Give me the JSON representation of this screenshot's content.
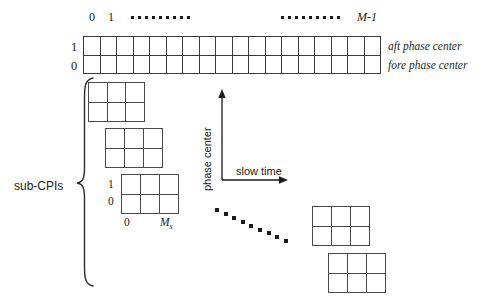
{
  "figure": {
    "line_color": "#3a3a3a",
    "text_color": "#1a1a1a"
  },
  "top_axis": {
    "labels": [
      {
        "text": "0"
      },
      {
        "text": "1"
      },
      {
        "text": "M-1"
      }
    ],
    "m_minus_one": "M-1",
    "dot_group_left_count": 9,
    "dot_group_right_count": 9
  },
  "long_grid": {
    "columns": 18,
    "rows": 2,
    "row_labels_left": [
      "1",
      "0"
    ],
    "row_labels_right": [
      "aft phase center",
      "fore phase center"
    ]
  },
  "brace": {
    "label": "sub-CPIs"
  },
  "axis_cross": {
    "x_label": "slow time",
    "y_label": "phase center"
  },
  "sub_blocks": [
    {
      "name": "sub-cpi-block-1",
      "cols": 3,
      "rows": 2
    },
    {
      "name": "sub-cpi-block-2",
      "cols": 3,
      "rows": 2
    },
    {
      "name": "sub-cpi-block-3",
      "cols": 3,
      "rows": 2
    },
    {
      "name": "sub-cpi-block-4",
      "cols": 3,
      "rows": 2
    },
    {
      "name": "sub-cpi-block-5",
      "cols": 3,
      "rows": 2
    }
  ],
  "block3_axes": {
    "y_ticks": [
      "1",
      "0"
    ],
    "x_tick_zero": "0",
    "x_tick_ms": "M",
    "x_tick_ms_sub": "s"
  },
  "diagonal_dots": {
    "count": 9
  }
}
